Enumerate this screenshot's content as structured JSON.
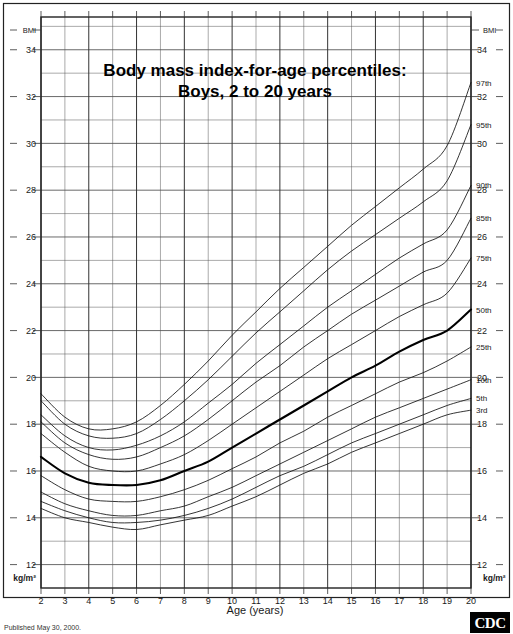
{
  "title": {
    "line1": "Body mass index-for-age percentiles:",
    "line2": "Boys, 2 to 20 years"
  },
  "footer": {
    "published": "Published May 30, 2000.",
    "logo": "CDC"
  },
  "axes": {
    "left_header": "BMI",
    "right_header": "BMI",
    "left_unit": "kg/m²",
    "right_unit": "kg/m²",
    "x_title": "Age (years)",
    "y_ticks": [
      "34",
      "32",
      "30",
      "28",
      "26",
      "24",
      "22",
      "20",
      "18",
      "16",
      "14",
      "12"
    ],
    "x_ticks": [
      "2",
      "3",
      "4",
      "5",
      "6",
      "7",
      "8",
      "9",
      "10",
      "11",
      "12",
      "13",
      "14",
      "15",
      "16",
      "17",
      "18",
      "19",
      "20"
    ]
  },
  "colors": {
    "background": "#ffffff",
    "grid": "#555555",
    "frame": "#222222",
    "curve": "#111111",
    "curve_bold": "#000000",
    "logo_box": "#000000",
    "logo_text": "#ffffff"
  },
  "chart_data": {
    "type": "line",
    "xlabel": "Age (years)",
    "ylabel": "BMI",
    "yunit": "kg/m²",
    "xlim": [
      2,
      20
    ],
    "ylim": [
      11,
      35.4
    ],
    "grid": true,
    "legend": "curve-end labels at right",
    "x": [
      2,
      3,
      4,
      5,
      6,
      7,
      8,
      9,
      10,
      11,
      12,
      13,
      14,
      15,
      16,
      17,
      18,
      19,
      20
    ],
    "series": [
      {
        "name": "97th",
        "label": "97th",
        "values": [
          19.3,
          18.3,
          17.8,
          17.8,
          18.1,
          18.8,
          19.7,
          20.7,
          21.8,
          22.8,
          23.8,
          24.7,
          25.6,
          26.5,
          27.3,
          28.1,
          28.9,
          29.9,
          32.6
        ]
      },
      {
        "name": "95th",
        "label": "95th",
        "values": [
          19.0,
          18.0,
          17.5,
          17.4,
          17.6,
          18.2,
          19.0,
          19.9,
          20.9,
          21.9,
          22.8,
          23.7,
          24.6,
          25.4,
          26.1,
          26.8,
          27.5,
          28.4,
          30.8
        ]
      },
      {
        "name": "90th",
        "label": "90th",
        "values": [
          18.4,
          17.5,
          17.0,
          16.9,
          17.1,
          17.5,
          18.1,
          18.9,
          19.7,
          20.6,
          21.4,
          22.2,
          23.0,
          23.7,
          24.4,
          25.1,
          25.7,
          26.3,
          28.2
        ]
      },
      {
        "name": "85th",
        "label": "85th",
        "values": [
          18.1,
          17.2,
          16.7,
          16.5,
          16.6,
          17.0,
          17.5,
          18.2,
          19.0,
          19.8,
          20.5,
          21.3,
          22.0,
          22.7,
          23.3,
          23.9,
          24.5,
          25.0,
          26.8
        ]
      },
      {
        "name": "75th",
        "label": "75th",
        "values": [
          17.6,
          16.8,
          16.2,
          16.0,
          16.0,
          16.3,
          16.7,
          17.3,
          18.0,
          18.7,
          19.4,
          20.1,
          20.8,
          21.4,
          22.0,
          22.6,
          23.1,
          23.6,
          25.1
        ]
      },
      {
        "name": "50th",
        "label": "50th",
        "values": [
          16.6,
          15.9,
          15.5,
          15.4,
          15.4,
          15.6,
          16.0,
          16.4,
          17.0,
          17.6,
          18.2,
          18.8,
          19.4,
          20.0,
          20.5,
          21.1,
          21.6,
          22.0,
          22.9
        ]
      },
      {
        "name": "25th",
        "label": "25th",
        "values": [
          15.8,
          15.2,
          14.8,
          14.7,
          14.7,
          14.9,
          15.2,
          15.6,
          16.1,
          16.6,
          17.2,
          17.7,
          18.3,
          18.8,
          19.3,
          19.8,
          20.2,
          20.7,
          21.3
        ]
      },
      {
        "name": "10th",
        "label": "10th",
        "values": [
          15.1,
          14.6,
          14.3,
          14.1,
          14.1,
          14.3,
          14.5,
          14.9,
          15.3,
          15.8,
          16.3,
          16.8,
          17.3,
          17.8,
          18.3,
          18.7,
          19.1,
          19.5,
          19.9
        ]
      },
      {
        "name": "5th",
        "label": "5th",
        "values": [
          14.7,
          14.3,
          14.0,
          13.8,
          13.8,
          13.9,
          14.1,
          14.4,
          14.8,
          15.3,
          15.8,
          16.2,
          16.7,
          17.2,
          17.6,
          18.0,
          18.4,
          18.8,
          19.1
        ]
      },
      {
        "name": "3rd",
        "label": "3rd",
        "values": [
          14.4,
          14.0,
          13.8,
          13.6,
          13.5,
          13.7,
          13.9,
          14.1,
          14.5,
          14.9,
          15.4,
          15.9,
          16.3,
          16.8,
          17.2,
          17.6,
          18.0,
          18.4,
          18.6
        ]
      }
    ]
  }
}
